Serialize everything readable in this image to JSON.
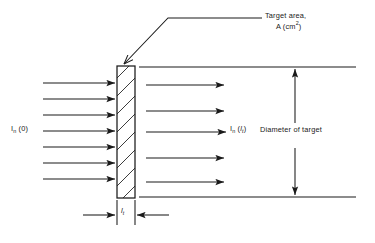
{
  "figure": {
    "type": "technical-diagram",
    "background_color": "#ffffff",
    "line_color": "#1a1a1a"
  },
  "labels": {
    "target_area_line1": "Target area,",
    "target_area_line2_prefix": "A (cm",
    "target_area_line2_exponent": "2",
    "target_area_line2_suffix": ")",
    "incident_symbol": "I",
    "incident_subscript": "n",
    "incident_argument": " (0)",
    "transmitted_symbol": "I",
    "transmitted_subscript": "n",
    "transmitted_argument_open": " (",
    "transmitted_argument_var": "l",
    "transmitted_argument_sub": "t",
    "transmitted_argument_close": ")",
    "diameter": "Diameter of target",
    "thickness_var": "l",
    "thickness_sub": "t"
  },
  "geometry": {
    "target_block": {
      "x": 117,
      "y": 66,
      "width": 18,
      "height": 132,
      "hatch_count": 9,
      "hatch_direction": "lower-left-to-upper-right"
    },
    "incident_arrows": {
      "count": 7,
      "x_start": 43,
      "x_end": 116,
      "y_values": [
        83,
        99,
        115,
        131,
        147,
        163,
        179
      ]
    },
    "transmitted_arrows": {
      "count": 5,
      "x_start": 146,
      "x_end": 226,
      "y_values": [
        85,
        111,
        132,
        158,
        182
      ]
    },
    "diameter_lines": {
      "x_start": 139,
      "x_end": 356,
      "y_top": 67,
      "y_bottom": 197
    },
    "diameter_dimension": {
      "x": 295,
      "y_top": 67,
      "y_bottom": 197
    },
    "leader_line": {
      "label_x": 262,
      "elbow_x": 168,
      "elbow_y": 18,
      "tip_x": 122,
      "tip_y": 66
    },
    "thickness_dimension": {
      "extension_left_x": 117,
      "extension_right_x": 135,
      "extension_y_top": 198,
      "extension_y_bottom": 225,
      "arrow_y": 215,
      "left_arrow_from_x": 83,
      "right_arrow_from_x": 169
    }
  }
}
